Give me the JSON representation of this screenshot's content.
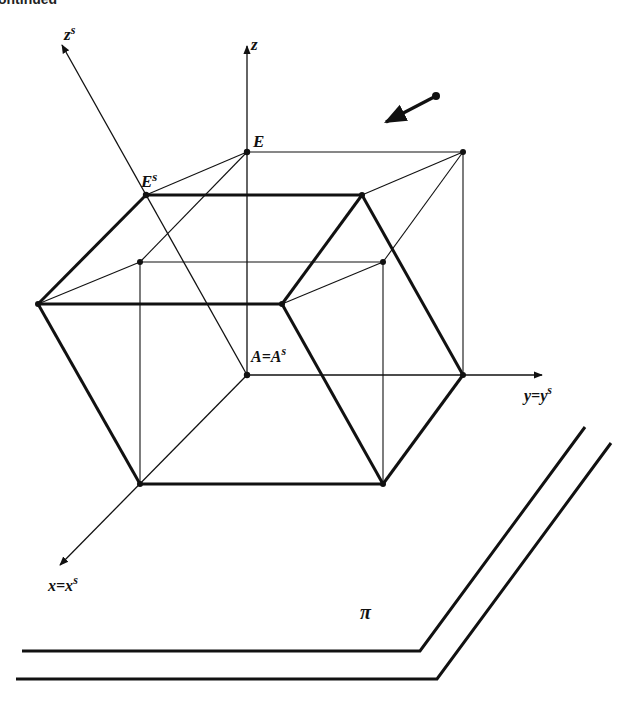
{
  "header": {
    "cropped_text": "ontinued"
  },
  "labels": {
    "zs_axis": "z",
    "zs_sup": "s",
    "z_axis": "z",
    "E": "E",
    "Es": "E",
    "Es_sup": "s",
    "A": "A=A",
    "A_sup": "s",
    "y_axis": "y=y",
    "y_sup": "s",
    "x_axis": "x=x",
    "x_sup": "s",
    "plane": "π"
  },
  "colors": {
    "ink": "#111111",
    "background": "#ffffff"
  },
  "points": {
    "A": [
      247,
      375
    ],
    "E": [
      247,
      152
    ],
    "Es": [
      146,
      195
    ],
    "top_right": [
      463,
      152
    ],
    "bold_top_right": [
      362,
      195
    ],
    "left": [
      38,
      304
    ],
    "bold_mid": [
      282,
      304
    ],
    "inner_left": [
      140,
      262
    ],
    "inner_right": [
      383,
      262
    ],
    "right": [
      463,
      375
    ],
    "bottom_left": [
      140,
      484
    ],
    "bottom_right": [
      383,
      484
    ]
  },
  "direction_arrow": {
    "from": [
      436,
      96
    ],
    "to": [
      385,
      122
    ]
  }
}
